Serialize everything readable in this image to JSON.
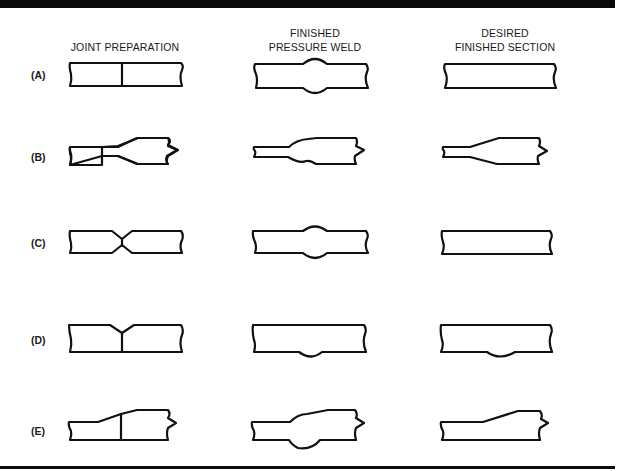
{
  "headers": {
    "joint_preparation": [
      "JOINT PREPARATION"
    ],
    "finished_pressure_weld": [
      "FINISHED",
      "PRESSURE WELD"
    ],
    "desired_finished_section": [
      "DESIRED",
      "FINISHED SECTION"
    ]
  },
  "rows": [
    {
      "label": "(A)",
      "joint": "square butt joint",
      "weld": "symmetric upset bulge top and bottom",
      "desired": "flush flat bar"
    },
    {
      "label": "(B)",
      "joint": "thin bar butted to tapered thick bar",
      "weld": "upset bulge at taper transition",
      "desired": "smooth taper from thin to thick"
    },
    {
      "label": "(C)",
      "joint": "double-chamfered (X) butt joint",
      "weld": "symmetric upset bulge top and bottom",
      "desired": "flush flat bar"
    },
    {
      "label": "(D)",
      "joint": "top-chamfered butt joint",
      "weld": "bulge on bottom only",
      "desired": "bottom bulge retained"
    },
    {
      "label": "(E)",
      "joint": "butt joint at sloped transition",
      "weld": "upset bulge top and bottom at transition",
      "desired": "smooth sloped transition"
    }
  ],
  "colors": {
    "ink": "#111111",
    "background": "#ffffff"
  }
}
